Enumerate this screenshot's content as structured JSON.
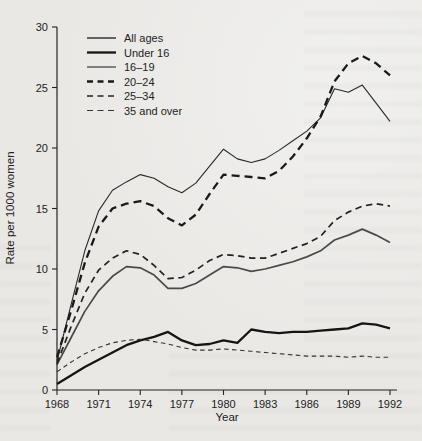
{
  "figure": {
    "paper_color": "#e9e8e5",
    "ink_color": "#232323",
    "frame": "L-shaped axes, no top/right border, no gridlines"
  },
  "chart_data": {
    "type": "line",
    "title": "",
    "xlabel": "Year",
    "ylabel": "Rate per 1000 women",
    "xlim": [
      1968,
      1992
    ],
    "ylim": [
      0,
      30
    ],
    "x_ticks": [
      1968,
      1971,
      1974,
      1977,
      1980,
      1983,
      1986,
      1989,
      1992
    ],
    "y_ticks": [
      0,
      5,
      10,
      15,
      20,
      25,
      30
    ],
    "grid": false,
    "legend_position": "upper-left-inside",
    "x": [
      1968,
      1969,
      1970,
      1971,
      1972,
      1973,
      1974,
      1975,
      1976,
      1977,
      1978,
      1979,
      1980,
      1981,
      1982,
      1983,
      1984,
      1985,
      1986,
      1987,
      1988,
      1989,
      1990,
      1991,
      1992
    ],
    "series": [
      {
        "name": "All ages",
        "line_style": "solid",
        "line_weight": "medium",
        "color": "#4a4a4a",
        "values": [
          2.1,
          4.3,
          6.5,
          8.2,
          9.4,
          10.2,
          10.1,
          9.5,
          8.4,
          8.4,
          8.8,
          9.5,
          10.2,
          10.1,
          9.8,
          10.0,
          10.3,
          10.6,
          11.0,
          11.5,
          12.4,
          12.8,
          13.3,
          12.8,
          12.2
        ]
      },
      {
        "name": "Under 16",
        "line_style": "solid",
        "line_weight": "thick",
        "color": "#151515",
        "values": [
          0.5,
          1.2,
          1.9,
          2.5,
          3.1,
          3.7,
          4.1,
          4.4,
          4.8,
          4.1,
          3.7,
          3.8,
          4.1,
          3.9,
          5.0,
          4.8,
          4.7,
          4.8,
          4.8,
          4.9,
          5.0,
          5.1,
          5.5,
          5.4,
          5.1
        ]
      },
      {
        "name": "16–19",
        "line_style": "solid",
        "line_weight": "thin",
        "color": "#2a2a2a",
        "values": [
          2.4,
          7.0,
          11.5,
          14.8,
          16.5,
          17.2,
          17.8,
          17.5,
          16.8,
          16.3,
          17.1,
          18.5,
          19.9,
          19.1,
          18.8,
          19.1,
          19.8,
          20.6,
          21.4,
          22.5,
          24.9,
          24.6,
          25.2,
          23.7,
          22.2
        ]
      },
      {
        "name": "20–24",
        "line_style": "dashed",
        "line_weight": "thick",
        "color": "#1a1a1a",
        "values": [
          2.7,
          6.5,
          10.5,
          13.5,
          15.0,
          15.4,
          15.6,
          15.2,
          14.2,
          13.6,
          14.5,
          16.2,
          17.8,
          17.7,
          17.6,
          17.5,
          18.1,
          19.3,
          20.8,
          22.6,
          25.5,
          27.0,
          27.6,
          27.0,
          26.0
        ]
      },
      {
        "name": "25–34",
        "line_style": "dashed",
        "line_weight": "medium",
        "color": "#222222",
        "values": [
          2.2,
          5.2,
          8.0,
          9.9,
          10.9,
          11.5,
          11.2,
          10.3,
          9.2,
          9.3,
          9.9,
          10.7,
          11.2,
          11.1,
          10.9,
          10.9,
          11.3,
          11.7,
          12.1,
          12.7,
          14.0,
          14.7,
          15.2,
          15.4,
          15.2
        ]
      },
      {
        "name": "35 and over",
        "line_style": "dashed",
        "line_weight": "thin",
        "color": "#333333",
        "values": [
          1.5,
          2.3,
          3.0,
          3.5,
          3.9,
          4.1,
          4.2,
          4.0,
          3.8,
          3.5,
          3.3,
          3.3,
          3.4,
          3.3,
          3.2,
          3.1,
          3.0,
          2.9,
          2.8,
          2.8,
          2.8,
          2.7,
          2.8,
          2.7,
          2.7
        ]
      }
    ]
  }
}
